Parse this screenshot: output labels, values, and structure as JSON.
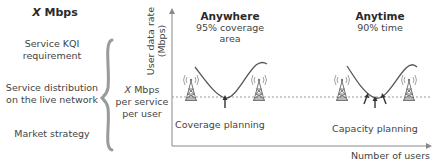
{
  "left_panel": {
    "title_var": "X",
    "title_unit": "Mbps",
    "factors": [
      {
        "line1": "Service KQI",
        "line2": "requirement"
      },
      {
        "line1": "Service distribution",
        "line2": "on the live network"
      },
      {
        "line1": "Market strategy",
        "line2": ""
      }
    ]
  },
  "middle_label": {
    "var": "X",
    "line1_unit": "Mbps",
    "line2": "per service",
    "line3": "per user"
  },
  "axes": {
    "y_label_line1": "User data rate",
    "y_label_line2": "(Mbps)",
    "x_label": "Number of users"
  },
  "scenarios": [
    {
      "heading": "Anywhere",
      "subheading": "95% coverage area",
      "planning": "Coverage planning",
      "icon": "cell-tower-icon"
    },
    {
      "heading": "Anytime",
      "subheading": "90% time",
      "planning": "Capacity planning",
      "icon": "cell-tower-icon"
    }
  ],
  "colors": {
    "line": "#555555",
    "axis": "#888888",
    "dashed": "#999999",
    "brace": "#9a9a9a",
    "tower": "#777777"
  }
}
